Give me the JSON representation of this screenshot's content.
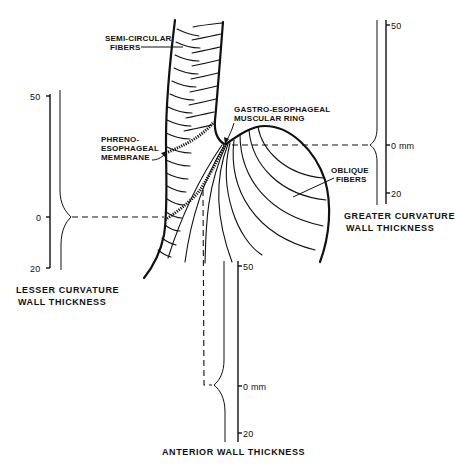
{
  "figure": {
    "background": "#ffffff",
    "ink": "#111111"
  },
  "labels": {
    "semi_circular_fibers": [
      "SEMI-CIRCULAR",
      "FIBERS"
    ],
    "phreno_esophageal_membrane": [
      "PHRENO-",
      "ESOPHAGEAL",
      "MEMBRANE"
    ],
    "gastro_esophageal_ring": [
      "GASTRO-ESOPHAGEAL",
      "MUSCULAR RING"
    ],
    "oblique_fibers": [
      "OBLIQUE",
      "FIBERS"
    ]
  },
  "scales": {
    "lesser_curvature": {
      "title": [
        "LESSER CURVATURE",
        "WALL THICKNESS"
      ],
      "ticks": [
        "50",
        "0",
        "20"
      ]
    },
    "greater_curvature": {
      "title": [
        "GREATER CURVATURE",
        "WALL THICKNESS"
      ],
      "ticks": [
        "50",
        "0 mm",
        "20"
      ]
    },
    "anterior_wall": {
      "title": "ANTERIOR WALL THICKNESS",
      "ticks": [
        "50",
        "0 mm",
        "20"
      ]
    }
  }
}
